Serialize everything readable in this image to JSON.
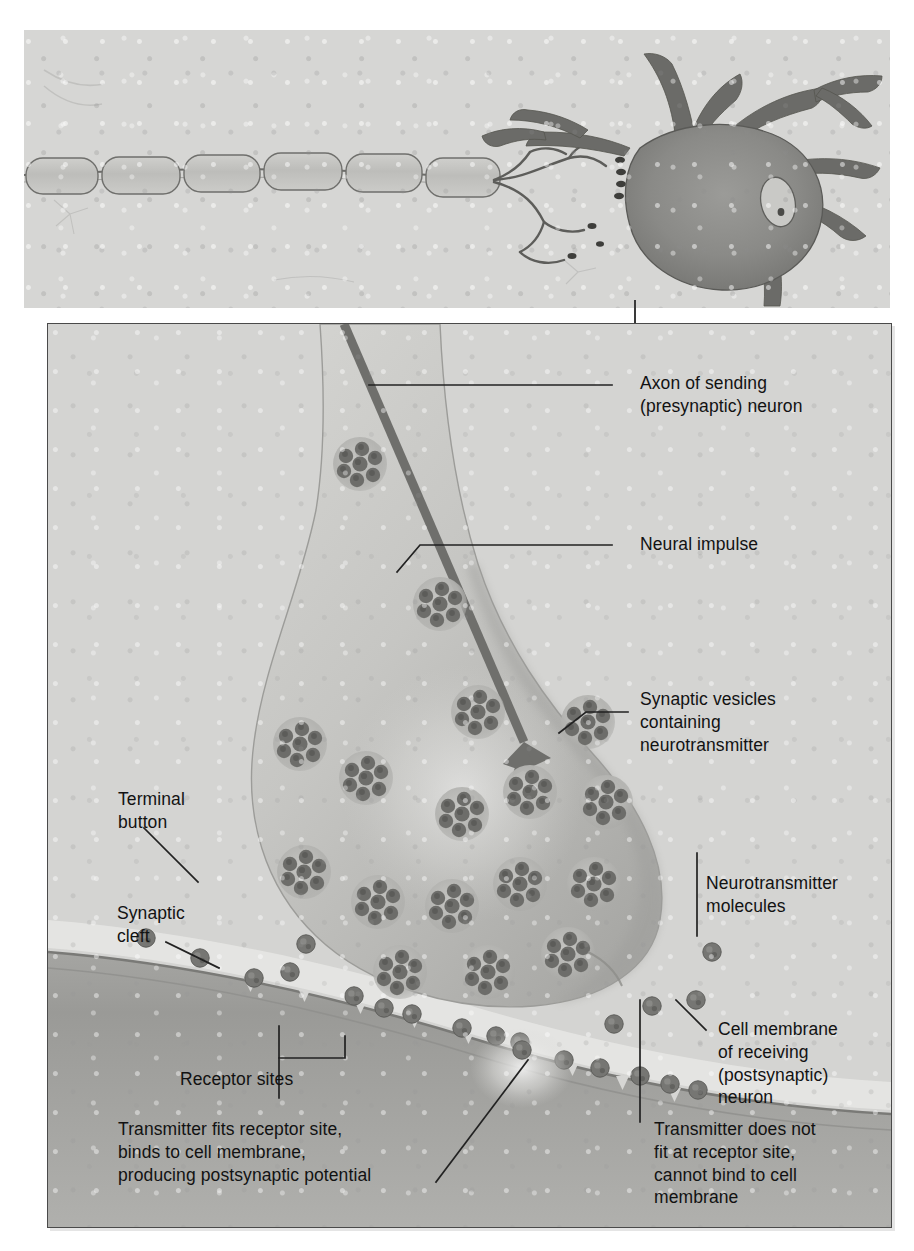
{
  "figure": {
    "title_visible": false,
    "type": "anatomical-illustration"
  },
  "top_panel": {
    "name": "whole-neuron-overview",
    "elements": [
      {
        "name": "myelinated-axon",
        "description": "myelin sheath segments along axon"
      },
      {
        "name": "neuron-cell-body",
        "description": "soma with nucleus"
      },
      {
        "name": "nucleus",
        "description": "oval nucleus with nucleolus"
      },
      {
        "name": "dendrites",
        "description": "branching dendrites"
      },
      {
        "name": "terminal-buttons",
        "description": "axon terminals contacting soma"
      }
    ]
  },
  "detail_panel": {
    "name": "synapse-closeup",
    "elements": [
      {
        "name": "terminal-button-body"
      },
      {
        "name": "neural-impulse-arrow"
      },
      {
        "name": "synaptic-vesicles"
      },
      {
        "name": "neurotransmitter-molecules"
      },
      {
        "name": "synaptic-cleft"
      },
      {
        "name": "postsynaptic-membrane"
      },
      {
        "name": "receptor-sites"
      }
    ]
  },
  "labels": {
    "axon_of_sending": "Axon of sending\n(presynaptic) neuron",
    "neural_impulse": "Neural impulse",
    "synaptic_vesicles": "Synaptic vesicles\ncontaining\nneurotransmitter",
    "terminal_button": "Terminal\nbutton",
    "synaptic_cleft": "Synaptic\ncleft",
    "neurotransmitter_molecules": "Neurotransmitter\nmolecules",
    "cell_membrane": "Cell membrane\nof receiving\n(postsynaptic)\nneuron",
    "receptor_sites": "Receptor sites",
    "transmitter_fits": "Transmitter fits receptor site,\nbinds to cell membrane,\nproducing postsynaptic potential",
    "transmitter_does_not_fit": "Transmitter does not\nfit at receptor site,\ncannot bind to cell\nmembrane"
  },
  "colors": {
    "panel_background": "#d4d4d2",
    "top_background": "#d6d6d4",
    "ink": "#121212",
    "leader_line": "#2b2b2b",
    "terminal_fill": "#c3c3c0",
    "membrane": "#9a9a97",
    "vesicle": "#a9a9a6",
    "molecule": "#6e6e6b",
    "impulse_arrow": "#6b6b68",
    "panel_border": "#4a4a4a"
  }
}
